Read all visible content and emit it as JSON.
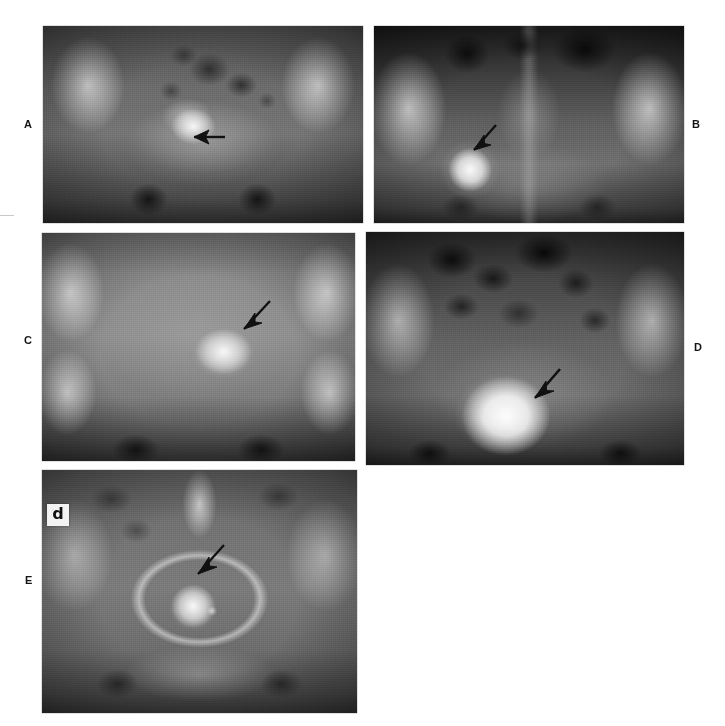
{
  "figure": {
    "modality": "plain-radiograph",
    "layout": "5-panel composite, 2 columns x 3 rows (A,B / C,D / E)",
    "background_color": "#ffffff",
    "label_color": "#141414",
    "annotation_color": "#111111"
  },
  "panels": [
    {
      "id": "a",
      "label": "A",
      "label_position": "left",
      "description": "Antero-posterior pelvic radiograph; ill-defined coarse calcification within the pelvis",
      "annotation": {
        "type": "arrow",
        "direction": "left",
        "points_to": "calcified pelvic mass"
      },
      "marker": null
    },
    {
      "id": "b",
      "label": "B",
      "label_position": "right",
      "description": "Antero-posterior pelvic radiograph; well circumscribed round calcified mass in left hemipelvis",
      "annotation": {
        "type": "arrow",
        "direction": "down-left",
        "points_to": "round calcified mass"
      },
      "marker": null
    },
    {
      "id": "c",
      "label": "C",
      "label_position": "left",
      "description": "Antero-posterior pelvic radiograph; cauliflower-like clustered calcification right of midline",
      "annotation": {
        "type": "arrow",
        "direction": "down-left",
        "points_to": "clustered calcification"
      },
      "marker": null
    },
    {
      "id": "d",
      "label": "D",
      "label_position": "right",
      "description": "Antero-posterior pelvic radiograph with bowel gas; large densely calcified pelvic mass",
      "annotation": {
        "type": "arrow",
        "direction": "down-left",
        "points_to": "large calcified mass"
      },
      "marker": null
    },
    {
      "id": "e",
      "label": "E",
      "label_position": "left",
      "description": "Antero-posterior pelvic radiograph; small rounded calcified mass within the pelvic ring",
      "annotation": {
        "type": "arrow",
        "direction": "down-left",
        "points_to": "small calcified mass"
      },
      "marker": {
        "type": "radiographic-side-marker",
        "text": "p"
      }
    }
  ]
}
